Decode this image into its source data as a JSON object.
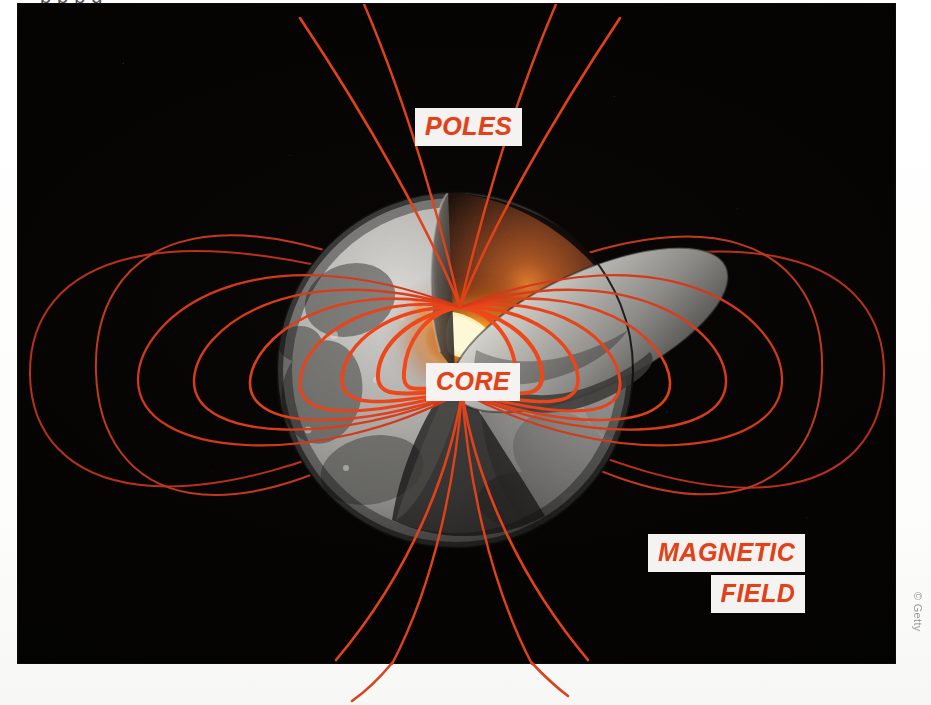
{
  "page": {
    "headline_sliver": "p     p       p    g",
    "background_color": "#ffffff"
  },
  "photo": {
    "alt_name": "moon-cutaway-magnetic-field-illustration",
    "background_color": "#040302",
    "subject": "Moon cutaway showing glowing core with magnetic field lines"
  },
  "labels": {
    "poles": "POLES",
    "core": "CORE",
    "magnetic": "MAGNETIC",
    "field": "FIELD",
    "label_text_color": "#e0431b",
    "label_background_color": "#f4f3f1"
  },
  "credit": {
    "text": "© Getty",
    "color": "#9a9a98"
  },
  "colors": {
    "field_line_bright": "#f04a1c",
    "field_line_dim": "#b8311a",
    "core_glow": "#ffdd6e",
    "mantle": "#7a3a1c",
    "moon_surface": "#b9b8b4",
    "space": "#040302"
  },
  "diagram": {
    "type": "illustration",
    "pole_north": {
      "x": 460,
      "y": 307
    },
    "pole_south": {
      "x": 462,
      "y": 392
    },
    "moon_center": {
      "x": 455,
      "y": 370
    },
    "moon_radius": 178,
    "field_loop_half_widths": [
      65,
      100,
      140,
      185,
      235,
      290,
      360
    ],
    "field_loop_heights": [
      110,
      170,
      235,
      300,
      360,
      430,
      500
    ],
    "parts": [
      {
        "name": "poles",
        "label": "POLES"
      },
      {
        "name": "core",
        "label": "CORE"
      },
      {
        "name": "magnetic-field",
        "label": "MAGNETIC FIELD"
      }
    ]
  }
}
